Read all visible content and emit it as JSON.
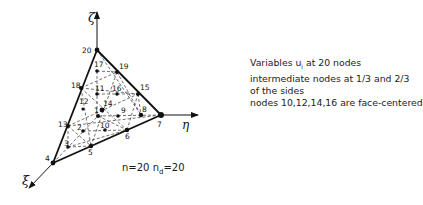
{
  "diagram": {
    "type": "20-node tetrahedral finite element",
    "axes": {
      "zeta": {
        "label": "ζ"
      },
      "eta": {
        "label": "η"
      },
      "xi": {
        "label": "ξ"
      }
    },
    "vertices": {
      "n20": "20",
      "n7": "7",
      "n4": "4"
    },
    "node_labels": [
      "1",
      "2",
      "3",
      "5",
      "6",
      "8",
      "9",
      "10",
      "11",
      "12",
      "13",
      "14",
      "15",
      "16",
      "17",
      "18",
      "19"
    ],
    "caption": {
      "line1": "Variables u",
      "line1_sub": "i",
      "line1_rest": " at 20 nodes",
      "line2": "intermediate nodes at 1/3 and 2/3",
      "line3": "of the sides",
      "line4": "nodes 10,12,14,16 are face-centered"
    },
    "counts": {
      "n_label": "n=20",
      "nd_label": "n",
      "nd_sub": "d",
      "nd_value": "=20"
    }
  }
}
